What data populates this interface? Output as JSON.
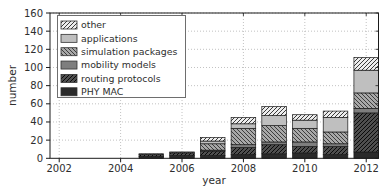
{
  "chart_data": {
    "type": "bar",
    "stacked": true,
    "xlabel": "year",
    "ylabel": "number",
    "x": [
      2005,
      2006,
      2007,
      2008,
      2009,
      2010,
      2011,
      2012
    ],
    "series": [
      {
        "name": "PHY MAC",
        "values": [
          2,
          3,
          3,
          4,
          5,
          6,
          4,
          7
        ],
        "fill": "#2a2a2a",
        "hatch": "none",
        "hatch_color": null
      },
      {
        "name": "routing protocols",
        "values": [
          2,
          3,
          5,
          8,
          10,
          7,
          9,
          43
        ],
        "fill": "#4f4f4f",
        "hatch": "diag-up",
        "hatch_color": "#0a0a0a"
      },
      {
        "name": "mobility models",
        "values": [
          0,
          0,
          1,
          3,
          3,
          5,
          3,
          5
        ],
        "fill": "#7e7e7e",
        "hatch": "none",
        "hatch_color": null
      },
      {
        "name": "simulation packages",
        "values": [
          1,
          1,
          7,
          18,
          18,
          15,
          13,
          17
        ],
        "fill": "#a8a8a8",
        "hatch": "diag-down",
        "hatch_color": "#3d3d3d"
      },
      {
        "name": "applications",
        "values": [
          0,
          0,
          3,
          5,
          11,
          9,
          16,
          25
        ],
        "fill": "#bfbfbf",
        "hatch": "none",
        "hatch_color": null
      },
      {
        "name": "other",
        "values": [
          0,
          0,
          4,
          7,
          10,
          6,
          7,
          14
        ],
        "fill": "#ededed",
        "hatch": "diag-up",
        "hatch_color": "#3a3a3a"
      }
    ],
    "totals": [
      5,
      7,
      23,
      45,
      57,
      48,
      52,
      111
    ],
    "legend": {
      "position": "upper-left",
      "entries": [
        "other",
        "applications",
        "simulation packages",
        "mobility models",
        "routing protocols",
        "PHY MAC"
      ]
    },
    "xlim": [
      2001.7,
      2012.4
    ],
    "ylim": [
      0,
      160
    ],
    "x_ticks": [
      2002,
      2004,
      2006,
      2008,
      2010,
      2012
    ],
    "y_ticks": [
      0,
      20,
      40,
      60,
      80,
      100,
      120,
      140,
      160
    ],
    "grid": "dotted"
  },
  "colors": {
    "background": "#ffffff",
    "frame": "#1a1a1a",
    "grid": "#b3b3b3",
    "text": "#2e2e2e",
    "bar_outline": "#1a1a1a",
    "legend_border": "#6e6e6e",
    "legend_background": "#ffffff"
  }
}
